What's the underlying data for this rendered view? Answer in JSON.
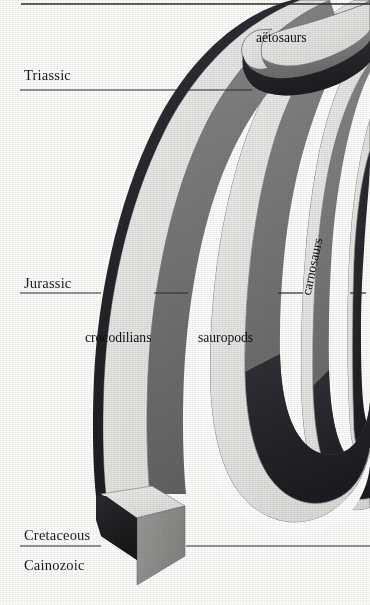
{
  "figure": {
    "kind": "spindle-diagram",
    "background_color": "#fdfdfc",
    "band_fill_color": "#e3e3e1",
    "band_shadow_color": "#6e6e6e",
    "band_dark_color": "#26262a",
    "band_outline_color": "#4a4a4a",
    "rule_color": "#2b2b2b"
  },
  "time_axis": {
    "orientation": "vertical",
    "direction": "oldest at top, youngest at bottom",
    "periods": [
      {
        "name": "Triassic",
        "label_x": 24,
        "label_y": 81,
        "rule_y": 90,
        "rule_x1": 20,
        "rule_x2": 370
      },
      {
        "name": "Jurassic",
        "label_x": 24,
        "label_y": 289,
        "rule_y": 293,
        "rule_x1": 20,
        "rule_x2": 370
      },
      {
        "name": "Cretaceous",
        "label_x": 24,
        "label_y": 542,
        "rule_y": 546,
        "rule_x1": 20,
        "rule_x2": 370
      },
      {
        "name": "Cainozoic",
        "label_x": 24,
        "label_y": 572,
        "rule_y": null,
        "rule_x1": null,
        "rule_x2": null
      }
    ],
    "top_rule": {
      "y": 4,
      "x1": 21,
      "x2": 370
    }
  },
  "taxa": [
    {
      "name": "aëtosaurs",
      "label_x": 256,
      "label_y": 44,
      "rotated": false,
      "extinction": "rounded terminus, Triassic"
    },
    {
      "name": "crocodilians",
      "label_x": 85,
      "label_y": 344,
      "rotated": false,
      "extinction": "survives to present, 3-D block terminus"
    },
    {
      "name": "sauropods",
      "label_x": 198,
      "label_y": 344,
      "rotated": false,
      "extinction": "rounded terminus, end-Cretaceous"
    },
    {
      "name": "carnosaurs",
      "label_x": 320,
      "label_y": 356,
      "rotated": true,
      "extinction": "rounded terminus, end-Cretaceous"
    }
  ]
}
